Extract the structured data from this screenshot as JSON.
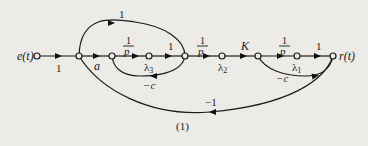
{
  "diagram": {
    "type": "signal-flow-graph",
    "caption": "(1)",
    "input_label": "e(t)",
    "output_label": "r(t)",
    "nodes": [
      {
        "id": "e",
        "label": "e(t)"
      },
      {
        "id": "n1",
        "label": ""
      },
      {
        "id": "n2",
        "label": ""
      },
      {
        "id": "n3",
        "label": "λ3"
      },
      {
        "id": "n4",
        "label": ""
      },
      {
        "id": "n5",
        "label": "λ2"
      },
      {
        "id": "n6",
        "label": ""
      },
      {
        "id": "n7",
        "label": "λ1"
      },
      {
        "id": "r",
        "label": "r(t)"
      }
    ],
    "edges": [
      {
        "from": "e",
        "to": "n1",
        "gain": "1"
      },
      {
        "from": "n1",
        "to": "n2",
        "gain": "a"
      },
      {
        "from": "n2",
        "to": "n3",
        "gain_num": "1",
        "gain_den": "p"
      },
      {
        "from": "n3",
        "to": "n4",
        "gain": "1"
      },
      {
        "from": "n4",
        "to": "n5",
        "gain_num": "1",
        "gain_den": "p"
      },
      {
        "from": "n5",
        "to": "n6",
        "gain": "K"
      },
      {
        "from": "n6",
        "to": "n7",
        "gain_num": "1",
        "gain_den": "p"
      },
      {
        "from": "n7",
        "to": "r",
        "gain": "1"
      },
      {
        "from": "n1",
        "to": "n4",
        "gain": "1",
        "kind": "feedforward-top"
      },
      {
        "from": "n4",
        "to": "n2",
        "gain": "-c",
        "kind": "feedback-loop"
      },
      {
        "from": "r",
        "to": "n6",
        "gain": "-c",
        "kind": "feedback-loop"
      },
      {
        "from": "r",
        "to": "n1",
        "gain": "-1",
        "kind": "feedback-bottom"
      }
    ],
    "labels": {
      "e_to_n1": "1",
      "n1_to_n2": "a",
      "frac_num": "1",
      "frac_den": "p",
      "n3_to_n4": "1",
      "k": "K",
      "n7_to_r": "1",
      "top_arc": "1",
      "loop1": "−c",
      "loop2": "−c",
      "bottom_arc": "−1",
      "lambda3": "λ",
      "lambda3_sub": "3",
      "lambda2": "λ",
      "lambda2_sub": "2",
      "lambda1": "λ",
      "lambda1_sub": "1"
    }
  }
}
